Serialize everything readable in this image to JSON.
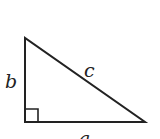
{
  "diagram": {
    "type": "right-triangle",
    "labels": {
      "leg_vertical": "b",
      "hypotenuse": "c",
      "leg_horizontal": "a"
    },
    "vertices": {
      "top": [
        25,
        38
      ],
      "right_angle": [
        25,
        122
      ],
      "right": [
        145,
        122
      ]
    },
    "right_angle_marker": true,
    "stroke_color": "#222222",
    "background_color": "#ffffff"
  }
}
